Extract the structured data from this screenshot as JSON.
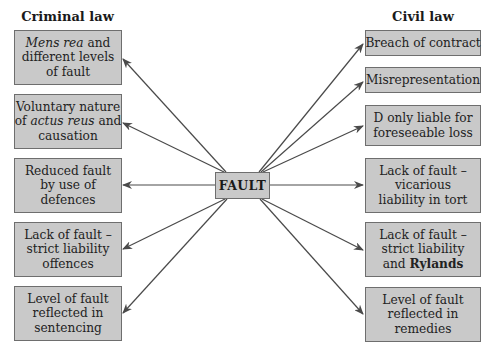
{
  "headings": {
    "left": "Criminal law",
    "right": "Civil law"
  },
  "center": {
    "label": "FAULT"
  },
  "criminal_law": {
    "items": [
      {
        "lines": [
          {
            "parts": [
              {
                "text": "Mens rea",
                "style": "italic"
              },
              {
                "text": " and",
                "style": "normal"
              }
            ]
          },
          {
            "parts": [
              {
                "text": "different levels",
                "style": "normal"
              }
            ]
          },
          {
            "parts": [
              {
                "text": "of fault",
                "style": "normal"
              }
            ]
          }
        ]
      },
      {
        "lines": [
          {
            "parts": [
              {
                "text": "Voluntary nature",
                "style": "normal"
              }
            ]
          },
          {
            "parts": [
              {
                "text": "of ",
                "style": "normal"
              },
              {
                "text": "actus reus",
                "style": "italic"
              },
              {
                "text": " and",
                "style": "normal"
              }
            ]
          },
          {
            "parts": [
              {
                "text": "causation",
                "style": "normal"
              }
            ]
          }
        ]
      },
      {
        "lines": [
          {
            "parts": [
              {
                "text": "Reduced fault",
                "style": "normal"
              }
            ]
          },
          {
            "parts": [
              {
                "text": "by use of",
                "style": "normal"
              }
            ]
          },
          {
            "parts": [
              {
                "text": "defences",
                "style": "normal"
              }
            ]
          }
        ]
      },
      {
        "lines": [
          {
            "parts": [
              {
                "text": "Lack of fault –",
                "style": "normal"
              }
            ]
          },
          {
            "parts": [
              {
                "text": "strict liability",
                "style": "normal"
              }
            ]
          },
          {
            "parts": [
              {
                "text": "offences",
                "style": "normal"
              }
            ]
          }
        ]
      },
      {
        "lines": [
          {
            "parts": [
              {
                "text": "Level of fault",
                "style": "normal"
              }
            ]
          },
          {
            "parts": [
              {
                "text": "reflected in",
                "style": "normal"
              }
            ]
          },
          {
            "parts": [
              {
                "text": "sentencing",
                "style": "normal"
              }
            ]
          }
        ]
      }
    ]
  },
  "civil_law": {
    "items": [
      {
        "lines": [
          {
            "parts": [
              {
                "text": "Breach of contract",
                "style": "normal"
              }
            ]
          }
        ]
      },
      {
        "lines": [
          {
            "parts": [
              {
                "text": "Misrepresentation",
                "style": "normal"
              }
            ]
          }
        ]
      },
      {
        "lines": [
          {
            "parts": [
              {
                "text": "D only liable for",
                "style": "normal"
              }
            ]
          },
          {
            "parts": [
              {
                "text": "foreseeable loss",
                "style": "normal"
              }
            ]
          }
        ]
      },
      {
        "lines": [
          {
            "parts": [
              {
                "text": "Lack of fault –",
                "style": "normal"
              }
            ]
          },
          {
            "parts": [
              {
                "text": "vicarious",
                "style": "normal"
              }
            ]
          },
          {
            "parts": [
              {
                "text": "liability in tort",
                "style": "normal"
              }
            ]
          }
        ]
      },
      {
        "lines": [
          {
            "parts": [
              {
                "text": "Lack of fault –",
                "style": "normal"
              }
            ]
          },
          {
            "parts": [
              {
                "text": "strict liability",
                "style": "normal"
              }
            ]
          },
          {
            "parts": [
              {
                "text": "and ",
                "style": "normal"
              },
              {
                "text": "Rylands",
                "style": "bold"
              }
            ]
          }
        ]
      },
      {
        "lines": [
          {
            "parts": [
              {
                "text": "Level of fault",
                "style": "normal"
              }
            ]
          },
          {
            "parts": [
              {
                "text": "reflected in",
                "style": "normal"
              }
            ]
          },
          {
            "parts": [
              {
                "text": "remedies",
                "style": "normal"
              }
            ]
          }
        ]
      }
    ]
  },
  "colors": {
    "box_fill": "#c9c9c9",
    "box_border": "#6e6e6e",
    "arrow": "#4a4a4a",
    "text": "#222222"
  }
}
